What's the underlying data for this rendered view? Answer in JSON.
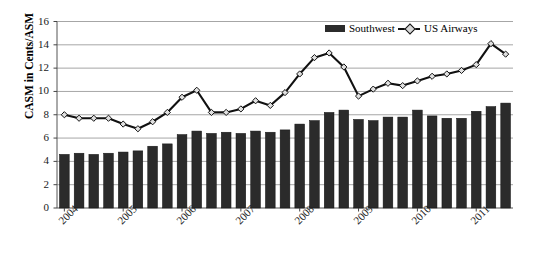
{
  "chart_data": {
    "type": "bar",
    "title": "",
    "xlabel": "",
    "ylabel": "CASM in Cents/ASM",
    "ylim": [
      0,
      16
    ],
    "yticks": [
      0,
      2,
      4,
      6,
      8,
      10,
      12,
      14,
      16
    ],
    "grid": true,
    "legend_position": "top-right",
    "x_tick_labels": [
      "2004",
      "2005",
      "2006",
      "2007",
      "2008",
      "2009",
      "2010",
      "2011"
    ],
    "x_tick_indices": [
      0,
      4,
      8,
      12,
      16,
      20,
      24,
      28
    ],
    "categories": [
      "2004Q1",
      "2004Q2",
      "2004Q3",
      "2004Q4",
      "2005Q1",
      "2005Q2",
      "2005Q3",
      "2005Q4",
      "2006Q1",
      "2006Q2",
      "2006Q3",
      "2006Q4",
      "2007Q1",
      "2007Q2",
      "2007Q3",
      "2007Q4",
      "2008Q1",
      "2008Q2",
      "2008Q3",
      "2008Q4",
      "2009Q1",
      "2009Q2",
      "2009Q3",
      "2009Q4",
      "2010Q1",
      "2010Q2",
      "2010Q3",
      "2010Q4",
      "2011Q1",
      "2011Q2",
      "2011Q3"
    ],
    "series": [
      {
        "name": "Southwest",
        "type": "bar",
        "color": "#2b2b2b",
        "values": [
          4.6,
          4.7,
          4.6,
          4.7,
          4.8,
          4.9,
          5.3,
          5.5,
          6.3,
          6.6,
          6.4,
          6.5,
          6.4,
          6.6,
          6.5,
          6.7,
          7.2,
          7.5,
          8.2,
          8.4,
          7.6,
          7.5,
          7.8,
          7.8,
          8.4,
          7.9,
          7.7,
          7.7,
          8.3,
          8.7,
          9.0
        ]
      },
      {
        "name": "US Airways",
        "type": "line",
        "color": "#111111",
        "marker": "diamond",
        "values": [
          8.0,
          7.7,
          7.7,
          7.7,
          7.2,
          6.8,
          7.4,
          8.2,
          9.5,
          10.1,
          8.2,
          8.2,
          8.5,
          9.2,
          8.8,
          9.9,
          11.5,
          12.9,
          13.3,
          12.1,
          9.6,
          10.2,
          10.7,
          10.5,
          10.9,
          11.3,
          11.5,
          11.8,
          12.3,
          14.1,
          13.2
        ]
      }
    ]
  },
  "legend": {
    "items": [
      {
        "label": "Southwest",
        "marker": "bar-swatch"
      },
      {
        "label": "US Airways",
        "marker": "line-diamond"
      }
    ]
  },
  "axis": {
    "y_label": "CASM in Cents/ASM"
  }
}
